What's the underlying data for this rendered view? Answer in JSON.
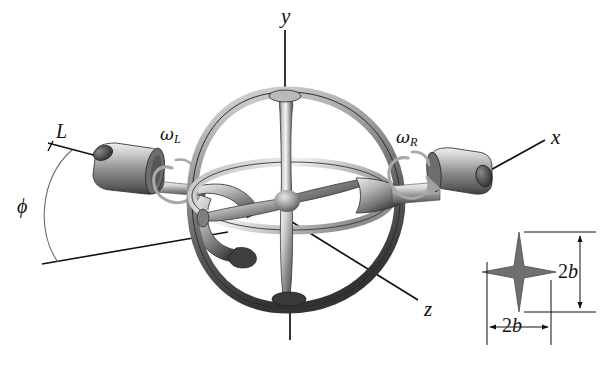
{
  "figure": {
    "type": "mechanical-engineering-diagram",
    "background_color": "#ffffff",
    "ink_color": "#111111"
  },
  "axes": {
    "x": {
      "label": "x",
      "description": "horizontal axis to the right"
    },
    "y": {
      "label": "y",
      "description": "vertical axis upward"
    },
    "z": {
      "label": "z",
      "description": "axis toward lower right"
    }
  },
  "angular_velocities": [
    {
      "key": "omega_L",
      "symbol": "ω",
      "subscript": "L",
      "side": "left"
    },
    {
      "key": "omega_R",
      "symbol": "ω",
      "subscript": "R",
      "side": "right"
    }
  ],
  "dimensions": {
    "length": {
      "label": "L",
      "description": "length dimension on left motor"
    },
    "angle": {
      "label": "ϕ",
      "description": "angle phi between reference lines"
    }
  },
  "inset": {
    "title": "cross-section of rotor arm",
    "shape": "four-pointed-star",
    "vertical_dim": {
      "value": "2b",
      "prefix": "2",
      "variable": "b"
    },
    "horizontal_dim": {
      "value": "2b",
      "prefix": "2",
      "variable": "b"
    }
  },
  "colors": {
    "metal_light": "#e8e8e8",
    "metal_mid": "#9a9a9a",
    "metal_dark": "#4a4a4a",
    "metal_darkest": "#2c2c2c",
    "arrow_gray": "#a8a8a8",
    "line": "#111111"
  }
}
